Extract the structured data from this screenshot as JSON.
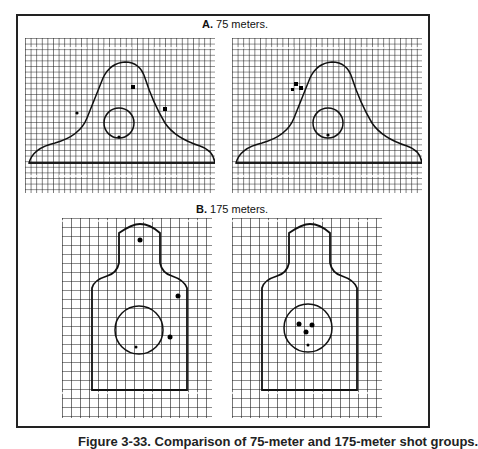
{
  "section_a": {
    "letter": "A.",
    "title": "75 meters."
  },
  "section_b": {
    "letter": "B.",
    "title": "175 meters."
  },
  "caption": "Figure 3-33. Comparison of 75-meter and 175-meter shot groups.",
  "targets": [
    {
      "id": "a-left",
      "range": "75 meters",
      "type": "silhouette-e",
      "shots": 4
    },
    {
      "id": "a-right",
      "range": "75 meters",
      "type": "silhouette-e",
      "shots": 4
    },
    {
      "id": "b-left",
      "range": "175 meters",
      "type": "silhouette-f",
      "shots": 4
    },
    {
      "id": "b-right",
      "range": "175 meters",
      "type": "silhouette-f",
      "shots": 4
    }
  ],
  "colors": {
    "ink": "#1a1a1a",
    "paper": "#ffffff"
  }
}
